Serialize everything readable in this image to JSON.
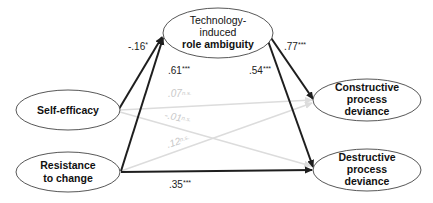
{
  "diagram": {
    "type": "path-model",
    "nodes": {
      "self_efficacy": {
        "lines": [
          "Self-efficacy"
        ],
        "bold": [
          true
        ]
      },
      "resistance": {
        "lines": [
          "Resistance",
          "to change"
        ],
        "bold": [
          true,
          true
        ]
      },
      "role_ambiguity": {
        "lines": [
          "Technology-",
          "induced",
          "role ambiguity"
        ],
        "bold": [
          false,
          false,
          true
        ]
      },
      "constructive": {
        "lines": [
          "Constructive",
          "process",
          "deviance"
        ],
        "bold": [
          true,
          true,
          true
        ]
      },
      "destructive": {
        "lines": [
          "Destructive",
          "process",
          "deviance"
        ],
        "bold": [
          true,
          true,
          true
        ]
      }
    },
    "paths": [
      {
        "id": "se_to_ra",
        "from": "Self-efficacy",
        "to": "Technology-induced role ambiguity",
        "coefficient": "-.16*",
        "significant": true
      },
      {
        "id": "rc_to_ra",
        "from": "Resistance to change",
        "to": "Technology-induced role ambiguity",
        "coefficient": ".61***",
        "significant": true
      },
      {
        "id": "ra_to_cpd",
        "from": "Technology-induced role ambiguity",
        "to": "Constructive process deviance",
        "coefficient": ".77***",
        "significant": true
      },
      {
        "id": "ra_to_dpd",
        "from": "Technology-induced role ambiguity",
        "to": "Destructive process deviance",
        "coefficient": ".54***",
        "significant": true
      },
      {
        "id": "se_to_cpd",
        "from": "Self-efficacy",
        "to": "Constructive process deviance",
        "coefficient": ".07n.s.",
        "significant": false
      },
      {
        "id": "se_to_dpd",
        "from": "Self-efficacy",
        "to": "Destructive process deviance",
        "coefficient": "-.01n.s.",
        "significant": false
      },
      {
        "id": "rc_to_cpd",
        "from": "Resistance to change",
        "to": "Constructive process deviance",
        "coefficient": ".12n.s.",
        "significant": false
      },
      {
        "id": "rc_to_dpd",
        "from": "Resistance to change",
        "to": "Destructive process deviance",
        "coefficient": ".35***",
        "significant": true
      }
    ],
    "labels": {
      "se_to_ra": {
        "value": "-.16",
        "sup": "*"
      },
      "rc_to_ra": {
        "value": ".61",
        "sup": "***"
      },
      "ra_to_cpd": {
        "value": ".77",
        "sup": "***"
      },
      "ra_to_dpd": {
        "value": ".54",
        "sup": "***"
      },
      "se_to_cpd": {
        "value": ".07",
        "sup": "n.s."
      },
      "se_to_dpd": {
        "value": "-.01",
        "sup": "n.s."
      },
      "rc_to_cpd": {
        "value": ".12",
        "sup": "n.s."
      },
      "rc_to_dpd": {
        "value": ".35",
        "sup": "***"
      }
    },
    "colors": {
      "significant_path": "#1e1e1e",
      "nonsignificant_path": "#dcdcdc",
      "ellipse_stroke": "#444444",
      "text": "#111111"
    }
  }
}
